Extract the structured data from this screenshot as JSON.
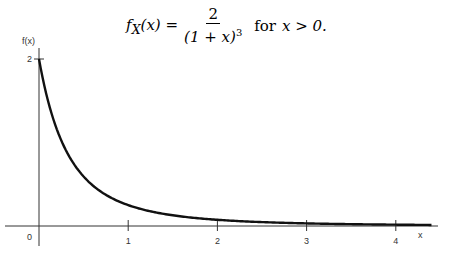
{
  "formula": {
    "lhs": "f",
    "lhs_sub": "X",
    "lhs_arg": "(x) =",
    "numerator": "2",
    "denominator": "(1 + x)",
    "exponent": "3",
    "condition_word": "for",
    "condition": "x > 0."
  },
  "chart_data": {
    "type": "line",
    "xlabel": "x",
    "ylabel": "f(x)",
    "xlim": [
      0,
      4.4
    ],
    "ylim": [
      0,
      2
    ],
    "x_ticks": [
      1,
      2,
      3,
      4
    ],
    "x_tick_labels": [
      "1",
      "2",
      "3",
      "4"
    ],
    "origin_label": "0",
    "y_ticks": [
      2
    ],
    "y_tick_labels": [
      "2"
    ],
    "grid": false,
    "legend": null,
    "series": [
      {
        "name": "f(x) = 2/(1+x)^3",
        "x": [
          0,
          0.1,
          0.2,
          0.3,
          0.4,
          0.5,
          0.75,
          1,
          1.5,
          2,
          2.5,
          3,
          3.5,
          4,
          4.4
        ],
        "y": [
          2.0,
          1.503,
          1.157,
          0.91,
          0.729,
          0.593,
          0.373,
          0.25,
          0.128,
          0.074,
          0.047,
          0.031,
          0.022,
          0.016,
          0.013
        ]
      }
    ]
  }
}
